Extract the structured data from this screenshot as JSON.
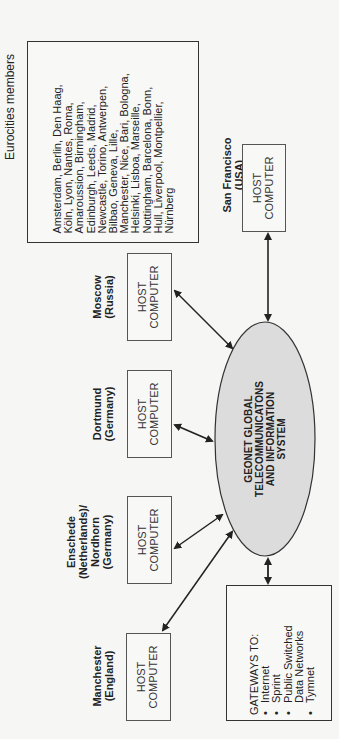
{
  "diagram": {
    "eurocities": {
      "title": "Eurocities members",
      "lines": [
        "Amsterdam, Berlin, Den Haag,",
        "Köln, Lyon, Nantes, Roma,",
        "Amaroussion, Birmingham,",
        "Edinburgh, Leeds, Madrid,",
        "Newcastle, Torino, Antwerpen,",
        "Bilbao, Geneva, Lille,",
        "Manchester, Nice, Bari, Bologna,",
        "Helsinki, Lisboa, Marseille,",
        "Nottingham, Barcelona, Bonn,",
        "Hull, Liverpool, Montpellier,",
        "Nürnberg"
      ]
    },
    "center": {
      "lines": [
        "GEONET GLOBAL",
        "TELECOMMUNICATONS",
        "AND INFORMATION",
        "SYSTEM"
      ],
      "fill": "#dcdcdc"
    },
    "hosts": [
      {
        "id": "san-francisco",
        "location": [
          "San Francisco",
          "(USA)"
        ],
        "box": [
          "HOST",
          "COMPUTER"
        ]
      },
      {
        "id": "moscow",
        "location": [
          "Moscow",
          "(Russia)"
        ],
        "box": [
          "HOST",
          "COMPUTER"
        ]
      },
      {
        "id": "dortmund",
        "location": [
          "Dortmund",
          "(Germany)"
        ],
        "box": [
          "HOST",
          "COMPUTER"
        ]
      },
      {
        "id": "enschede",
        "location": [
          "Enschede",
          "(Netherlands)/",
          "Nordhorn",
          "(Germany)"
        ],
        "box": [
          "HOST",
          "COMPUTER"
        ]
      },
      {
        "id": "manchester",
        "location": [
          "Manchester",
          "(England)"
        ],
        "box": [
          "HOST",
          "COMPUTER"
        ]
      }
    ],
    "gateways": {
      "title": "GATEWAYS TO:",
      "items": [
        {
          "bullet": "•",
          "text": "Internet"
        },
        {
          "bullet": "•",
          "text": "Sprint"
        },
        {
          "bullet": "•",
          "text": "Public Switched"
        },
        {
          "bullet": "",
          "text": "Data Networks"
        },
        {
          "bullet": "•",
          "text": "Tymnet"
        }
      ]
    }
  }
}
